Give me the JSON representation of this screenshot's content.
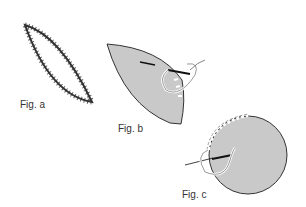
{
  "figures": {
    "a": {
      "label": "Fig. a",
      "description": "Leaf-shaped outline with overcast (zigzag) stitching around edge"
    },
    "b": {
      "label": "Fig. b",
      "description": "Gray leaf-shaped fabric piece with needle and looped thread, edge stitches"
    },
    "c": {
      "label": "Fig. c",
      "description": "Gray circular fabric piece with needle and looped thread, blanket stitches along upper-left edge"
    }
  },
  "colors": {
    "fabric_fill": "#c9c9c9",
    "outline": "#333333",
    "background": "#ffffff"
  }
}
